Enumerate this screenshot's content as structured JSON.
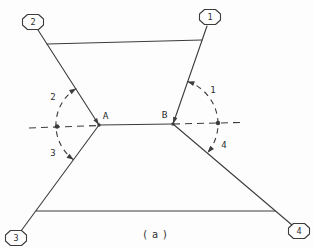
{
  "diagram": {
    "caption": "(a)",
    "colors": {
      "ink": "#3c3c3c",
      "background": "#fdfdfd"
    },
    "nodes": [
      {
        "id": "vertex-node-1",
        "label": "1",
        "cx": 210,
        "cy": 17
      },
      {
        "id": "vertex-node-2",
        "label": "2",
        "cx": 33,
        "cy": 22
      },
      {
        "id": "vertex-node-3",
        "label": "3",
        "cx": 16,
        "cy": 238
      },
      {
        "id": "vertex-node-4",
        "label": "4",
        "cx": 299,
        "cy": 231
      }
    ],
    "junction_points": [
      {
        "id": "point-A",
        "label": "A",
        "x": 99,
        "y": 125,
        "label_x": 105.5,
        "label_y": 118.5
      },
      {
        "id": "point-B",
        "label": "B",
        "x": 173,
        "y": 124,
        "label_x": 164.5,
        "label_y": 117.5
      }
    ],
    "angle_labels": [
      {
        "id": "angle-label-1",
        "label": "1",
        "x": 213,
        "y": 93
      },
      {
        "id": "angle-label-2",
        "label": "2",
        "x": 53,
        "y": 100
      },
      {
        "id": "angle-label-3",
        "label": "3",
        "x": 53,
        "y": 156
      },
      {
        "id": "angle-label-4",
        "label": "4",
        "x": 224,
        "y": 148
      }
    ],
    "solid_lines": [
      {
        "id": "link-node2-to-A",
        "x1": 38,
        "y1": 30,
        "x2": 99,
        "y2": 125
      },
      {
        "id": "link-node1-to-B",
        "x1": 207,
        "y1": 26,
        "x2": 173,
        "y2": 124
      },
      {
        "id": "link-node3-to-A",
        "x1": 21,
        "y1": 231,
        "x2": 99,
        "y2": 125
      },
      {
        "id": "link-node4-to-B",
        "x1": 292,
        "y1": 225,
        "x2": 173,
        "y2": 124
      },
      {
        "id": "top-crossbar-line",
        "x1": 47,
        "y1": 44,
        "x2": 202,
        "y2": 40
      },
      {
        "id": "bottom-crossbar-line",
        "x1": 36,
        "y1": 211,
        "x2": 275,
        "y2": 211
      },
      {
        "id": "segment-A-B",
        "x1": 99,
        "y1": 125,
        "x2": 173,
        "y2": 124
      }
    ],
    "dashed_lines": [
      {
        "id": "baseline-dashed-left",
        "x1": 29,
        "y1": 128,
        "x2": 99,
        "y2": 125.5
      },
      {
        "id": "baseline-dashed-right",
        "x1": 173,
        "y1": 124,
        "x2": 240,
        "y2": 122.5
      }
    ],
    "dashed_arcs": [
      {
        "id": "angle-arc-A",
        "d": "M 76.3 88.4 A 43 43 0 0 0 73.7 159.8"
      },
      {
        "id": "angle-arc-B",
        "d": "M 187.4 81.4 A 45 45 0 0 1 207.6 152.8"
      }
    ],
    "arrowheads": [
      {
        "id": "arc-arrowhead-angle2",
        "points": "76.3,88.4 71.6,94.2 69,90"
      },
      {
        "id": "arc-arrowhead-angle3",
        "points": "73.7,159.8 66.5,157.7 69.5,153.7"
      },
      {
        "id": "arc-arrowhead-angle1",
        "points": "187.4,81.4 194.8,81.3 193.2,86"
      },
      {
        "id": "arc-arrowhead-angle4",
        "points": "207.6,152.8 210.2,145.8 214,149"
      },
      {
        "id": "junction-arrowhead-A",
        "points": "99,125 93.4,120.3 97.1,117.9"
      },
      {
        "id": "junction-arrowhead-B",
        "points": "173,124 173.2,116.7 177.4,118.1"
      }
    ],
    "dots": [
      {
        "id": "reference-dot-left",
        "x": 57,
        "y": 126.5,
        "r": 2.2
      },
      {
        "id": "reference-dot-right",
        "x": 218,
        "y": 123,
        "r": 2.2
      },
      {
        "id": "junction-dot-A",
        "x": 99,
        "y": 125,
        "r": 1.7
      },
      {
        "id": "junction-dot-B",
        "x": 173,
        "y": 124,
        "r": 1.7
      }
    ]
  }
}
